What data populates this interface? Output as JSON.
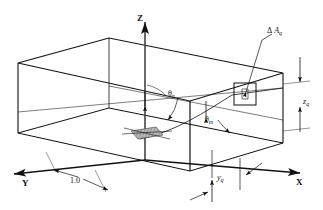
{
  "figure": {
    "type": "technical-line-diagram",
    "background": "#ffffff",
    "line_color": "#111111",
    "shade_color": "#9a9a9a"
  },
  "axes": [
    {
      "name": "z-axis",
      "label": "Z",
      "direction": "up"
    },
    {
      "name": "x-axis",
      "label": "X",
      "direction": "lower-right"
    },
    {
      "name": "y-axis",
      "label": "Y",
      "direction": "lower-left"
    }
  ],
  "labels": {
    "area_element": {
      "greek": "Δ",
      "symbol": "A",
      "subscript": "q"
    },
    "theta_n": {
      "greek": "θ",
      "subscript": "n"
    },
    "theta_m": {
      "greek": "θ",
      "subscript": "m"
    },
    "z_q": {
      "symbol": "z",
      "subscript": "q"
    },
    "y_q": {
      "symbol": "y",
      "subscript": "q"
    },
    "unit_dim": {
      "value": "1.0"
    }
  },
  "annotations": [
    {
      "name": "leader-to-area-element",
      "target": "ΔA_q",
      "style": "leader-line-with-arrow"
    },
    {
      "name": "angle-arc-theta-n",
      "target": "θ_n",
      "style": "curved-arrow"
    },
    {
      "name": "angle-arc-theta-m",
      "target": "θ_m",
      "style": "curved-arrow"
    },
    {
      "name": "dimension-z-q",
      "target": "z_q",
      "style": "double-arrow-vertical"
    },
    {
      "name": "dimension-y-q",
      "target": "y_q",
      "style": "double-arrow-vertical"
    },
    {
      "name": "dimension-unit",
      "target": "1.0",
      "style": "double-arrow-diagonal"
    }
  ]
}
